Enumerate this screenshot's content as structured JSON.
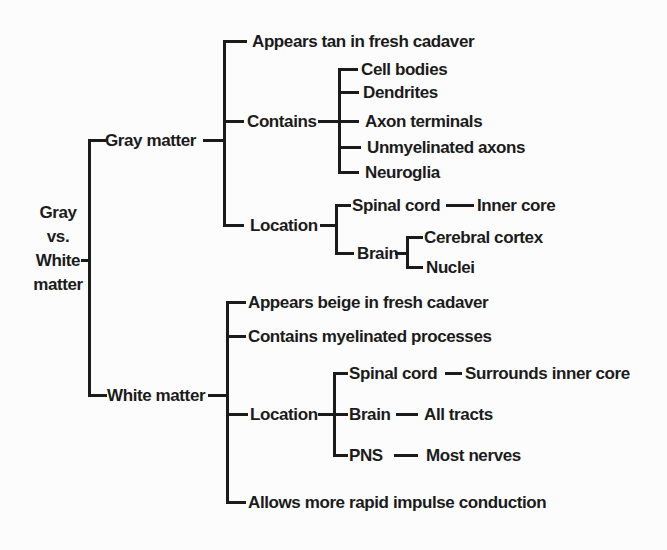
{
  "diagram": {
    "title": "Gray vs. White matter",
    "colors": {
      "ink": "#1b1b1b",
      "paper": "#fcfcfc"
    },
    "root": {
      "lines": [
        "Gray",
        "vs.",
        "White",
        "matter"
      ]
    },
    "branches": [
      {
        "label": "Gray matter",
        "children": [
          {
            "label": "Appears tan in fresh cadaver"
          },
          {
            "label": "Contains",
            "children": [
              {
                "label": "Cell bodies"
              },
              {
                "label": "Dendrites"
              },
              {
                "label": "Axon terminals"
              },
              {
                "label": "Unmyelinated axons"
              },
              {
                "label": "Neuroglia"
              }
            ]
          },
          {
            "label": "Location",
            "children": [
              {
                "label": "Spinal cord",
                "children": [
                  {
                    "label": "Inner core"
                  }
                ]
              },
              {
                "label": "Brain",
                "children": [
                  {
                    "label": "Cerebral cortex"
                  },
                  {
                    "label": "Nuclei"
                  }
                ]
              }
            ]
          }
        ]
      },
      {
        "label": "White matter",
        "children": [
          {
            "label": "Appears beige in fresh cadaver"
          },
          {
            "label": "Contains myelinated processes"
          },
          {
            "label": "Location",
            "children": [
              {
                "label": "Spinal cord",
                "children": [
                  {
                    "label": "Surrounds inner core"
                  }
                ]
              },
              {
                "label": "Brain",
                "children": [
                  {
                    "label": "All tracts"
                  }
                ]
              },
              {
                "label": "PNS",
                "children": [
                  {
                    "label": "Most nerves"
                  }
                ]
              }
            ]
          },
          {
            "label": "Allows more rapid impulse conduction"
          }
        ]
      }
    ]
  }
}
